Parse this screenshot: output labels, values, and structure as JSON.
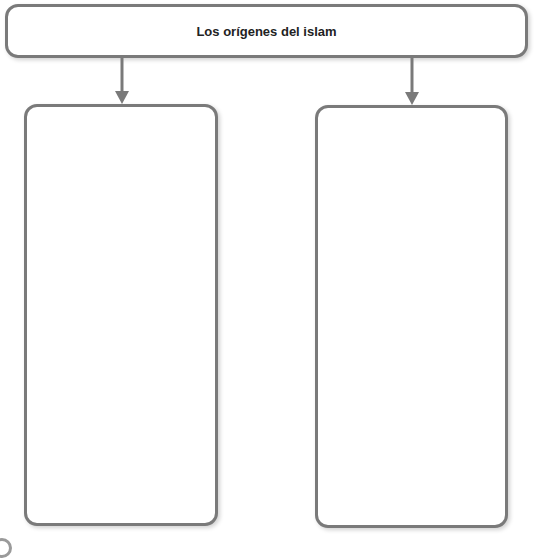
{
  "diagram": {
    "title": "Los orígenes del islam",
    "nodes": [
      {
        "id": "root",
        "label": "Los orígenes del islam"
      },
      {
        "id": "left",
        "label": ""
      },
      {
        "id": "right",
        "label": ""
      }
    ],
    "edges": [
      {
        "from": "root",
        "to": "left"
      },
      {
        "from": "root",
        "to": "right"
      }
    ],
    "colors": {
      "border": "#7a7a7a",
      "text": "#222222",
      "background": "#ffffff"
    }
  }
}
